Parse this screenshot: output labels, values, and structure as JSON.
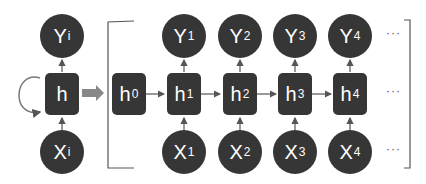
{
  "rolled": {
    "output": {
      "base": "Y",
      "sub": "i"
    },
    "hidden": {
      "base": "h",
      "sub": ""
    },
    "input": {
      "base": "X",
      "sub": "i"
    }
  },
  "unrolled": {
    "initial_hidden": {
      "base": "h",
      "sub": "0"
    },
    "steps": [
      {
        "output": {
          "base": "Y",
          "sub": "1"
        },
        "hidden": {
          "base": "h",
          "sub": "1"
        },
        "input": {
          "base": "X",
          "sub": "1"
        }
      },
      {
        "output": {
          "base": "Y",
          "sub": "2"
        },
        "hidden": {
          "base": "h",
          "sub": "2"
        },
        "input": {
          "base": "X",
          "sub": "2"
        }
      },
      {
        "output": {
          "base": "Y",
          "sub": "3"
        },
        "hidden": {
          "base": "h",
          "sub": "3"
        },
        "input": {
          "base": "X",
          "sub": "3"
        }
      },
      {
        "output": {
          "base": "Y",
          "sub": "4"
        },
        "hidden": {
          "base": "h",
          "sub": "4"
        },
        "input": {
          "base": "X",
          "sub": "4"
        }
      }
    ],
    "continuation": "···"
  },
  "colors": {
    "node": "#363636",
    "line": "#555555",
    "arrow_thick": "#888888"
  }
}
